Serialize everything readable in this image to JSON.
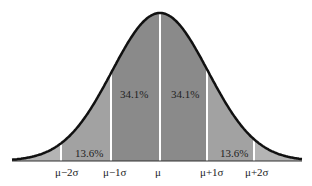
{
  "chart_data": {
    "type": "area",
    "title": "",
    "xlabel": "",
    "ylabel": "",
    "grid": false,
    "x_tick_labels": [
      "μ−2σ",
      "μ−1σ",
      "μ",
      "μ+1σ",
      "μ+2σ"
    ],
    "regions": [
      {
        "from": "-3σ",
        "to": "μ−2σ",
        "label": "",
        "shade": "light"
      },
      {
        "from": "μ−2σ",
        "to": "μ−1σ",
        "label": "13.6%",
        "value": 13.6,
        "shade": "medium"
      },
      {
        "from": "μ−1σ",
        "to": "μ",
        "label": "34.1%",
        "value": 34.1,
        "shade": "dark"
      },
      {
        "from": "μ",
        "to": "μ+1σ",
        "label": "34.1%",
        "value": 34.1,
        "shade": "dark"
      },
      {
        "from": "μ+1σ",
        "to": "μ+2σ",
        "label": "13.6%",
        "value": 13.6,
        "shade": "medium"
      },
      {
        "from": "μ+2σ",
        "to": "+3σ",
        "label": "",
        "shade": "light"
      }
    ]
  },
  "labels": {
    "region_left_outer": "13.6%",
    "region_left_inner": "34.1%",
    "region_right_inner": "34.1%",
    "region_right_outer": "13.6%",
    "tick_m2": "μ−2σ",
    "tick_m1": "μ−1σ",
    "tick_0": "μ",
    "tick_p1": "μ+1σ",
    "tick_p2": "μ+2σ"
  },
  "colors": {
    "tail": "#b4b4b4",
    "outer": "#a2a2a2",
    "inner": "#8a8a8a",
    "curve": "#111111",
    "divider": "#ffffff"
  }
}
